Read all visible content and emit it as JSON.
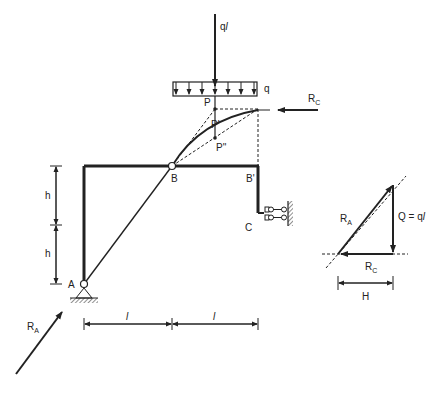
{
  "diagram": {
    "type": "structural frame with force polygon",
    "labels": {
      "load_ql": "q",
      "load_ql_l": "l",
      "distributed_load": "q",
      "point_P": "P",
      "point_P1": "P'",
      "point_P2": "P''",
      "reaction_RC": "R",
      "reaction_RC_sub": "C",
      "node_B": "B",
      "node_B1": "B'",
      "node_C": "C",
      "node_A": "A",
      "height_h1": "h",
      "height_h2": "h",
      "span_l1": "l",
      "span_l2": "l",
      "reaction_RA": "R",
      "reaction_RA_sub": "A"
    },
    "force_polygon": {
      "RA": "R",
      "RA_sub": "A",
      "Q_label": "Q = q",
      "Q_l": "l",
      "RC": "R",
      "RC_sub": "C",
      "H": "H"
    }
  }
}
